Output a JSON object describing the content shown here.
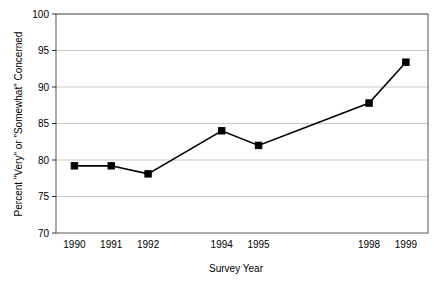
{
  "chart_data": {
    "type": "line",
    "title": "",
    "subtitle": "",
    "xlabel": "Survey Year",
    "ylabel": "Percent \"Very\" or \"Somewhat\" Concerned",
    "x": [
      1990,
      1991,
      1992,
      1994,
      1995,
      1998,
      1999
    ],
    "values": [
      79.2,
      79.2,
      78.1,
      84.0,
      82.0,
      87.8,
      93.4
    ],
    "categories": [
      "1990",
      "1991",
      "1992",
      "1994",
      "1995",
      "1998",
      "1999"
    ],
    "series": [
      {
        "name": "Percent Very or Somewhat Concerned",
        "values": [
          79.2,
          79.2,
          78.1,
          84.0,
          82.0,
          87.8,
          93.4
        ]
      }
    ],
    "xlim": [
      1989.5,
      1999.6
    ],
    "ylim": [
      70,
      100
    ],
    "x_tick_values": [
      1990,
      1991,
      1992,
      1994,
      1995,
      1998,
      1999
    ],
    "x_tick_labels": [
      "1990",
      "1991",
      "1992",
      "1994",
      "1995",
      "1998",
      "1999"
    ],
    "y_ticks": [
      70,
      75,
      80,
      85,
      90,
      95,
      100
    ],
    "y_tick_labels": [
      "70",
      "75",
      "80",
      "85",
      "90",
      "95",
      "100"
    ],
    "grid": "horizontal",
    "legend": "none",
    "marker": "square",
    "line_color": "#000000",
    "marker_color": "#000000",
    "grid_color": "#c8c8c8",
    "axis_color": "#555555",
    "background_color": "#ffffff"
  },
  "axes": {
    "y_title": "Percent \"Very\" or \"Somewhat\" Concerned",
    "x_title": "Survey Year"
  }
}
